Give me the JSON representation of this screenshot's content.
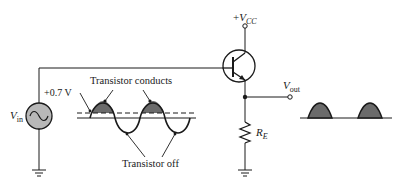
{
  "diagram": {
    "labels": {
      "vcc_prefix": "+",
      "vcc_main": "V",
      "vcc_sub": "CC",
      "vin_main": "V",
      "vin_sub": "in",
      "vout_main": "V",
      "vout_sub": "out",
      "re_main": "R",
      "re_sub": "E",
      "threshold": "+0.7 V",
      "conducts": "Transistor conducts",
      "off": "Transistor off"
    },
    "components": [
      {
        "type": "ac-voltage-source",
        "label": "Vin"
      },
      {
        "type": "npn-transistor"
      },
      {
        "type": "resistor",
        "label": "RE"
      },
      {
        "type": "ground",
        "count": 2
      },
      {
        "type": "terminal",
        "label": "+VCC"
      },
      {
        "type": "terminal",
        "label": "Vout"
      }
    ],
    "colors": {
      "line": "#1a1a1a",
      "shade": "#6b6b6b",
      "source_fill": "#b8b8b8"
    }
  }
}
